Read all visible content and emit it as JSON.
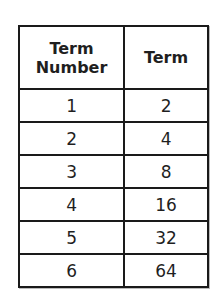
{
  "table": {
    "headers": [
      "Term\nNumber",
      "Term"
    ],
    "header_lines": [
      [
        "Term",
        "Number"
      ],
      [
        "Term"
      ]
    ],
    "rows": [
      {
        "term_number": "1",
        "term": "2"
      },
      {
        "term_number": "2",
        "term": "4"
      },
      {
        "term_number": "3",
        "term": "8"
      },
      {
        "term_number": "4",
        "term": "16"
      },
      {
        "term_number": "5",
        "term": "32"
      },
      {
        "term_number": "6",
        "term": "64"
      }
    ]
  }
}
